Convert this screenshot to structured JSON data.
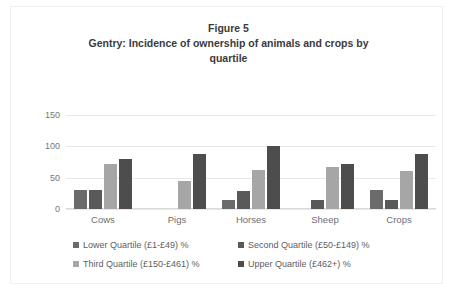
{
  "chart_data": {
    "type": "bar",
    "title": "Figure 5",
    "subtitle": "Gentry: Incidence of ownership of animals and crops by quartile",
    "title_lines": [
      "Figure 5",
      "Gentry: Incidence of ownership of animals and crops by",
      "quartile"
    ],
    "xlabel": "",
    "ylabel": "",
    "ylim": [
      0,
      150
    ],
    "yticks": [
      150,
      100,
      50,
      0
    ],
    "grid": true,
    "legend_position": "bottom",
    "categories": [
      "Cows",
      "Pigs",
      "Horses",
      "Sheep",
      "Crops"
    ],
    "series": [
      {
        "name": "Lower Quartile (£1-£49) %",
        "color": "#6b6b6b",
        "values": [
          30,
          0,
          15,
          0,
          30
        ]
      },
      {
        "name": "Second Quartile (£50-£149) %",
        "color": "#595959",
        "values": [
          30,
          0,
          28,
          15,
          15
        ]
      },
      {
        "name": "Third Quartile (£150-£461) %",
        "color": "#a6a6a6",
        "values": [
          72,
          45,
          63,
          67,
          60
        ]
      },
      {
        "name": "Upper  Quartile (£462+) %",
        "color": "#4d4d4d",
        "values": [
          80,
          87,
          100,
          72,
          88
        ]
      }
    ]
  },
  "colors": {
    "gridline": "#e8e8e8",
    "tick_text": "#767676",
    "title_text": "#3b3b3b",
    "legend_text": "#5e5e5e",
    "frame_border": "#f0f0f0"
  }
}
